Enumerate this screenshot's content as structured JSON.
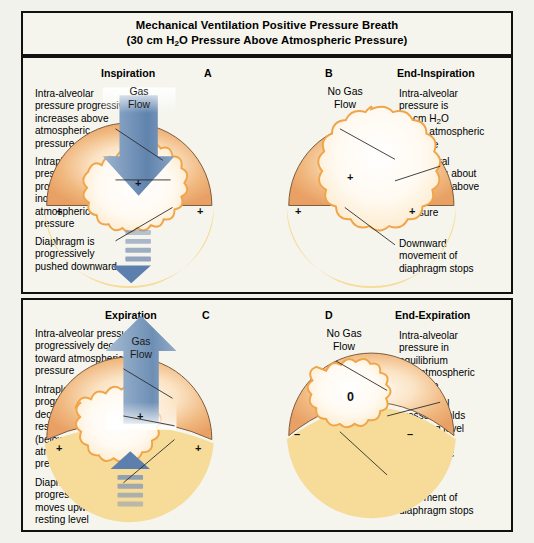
{
  "title": {
    "line1": "Mechanical Ventilation Positive Pressure Breath",
    "line2_pre": "(30 cm H",
    "line2_sub": "2",
    "line2_post": "O Pressure Above Atmospheric Pressure)"
  },
  "colors": {
    "border": "#111111",
    "background": "#f5f5ee",
    "lung_body": "#eeab6e",
    "lung_body_light": "#f7d9b4",
    "alveolar_light": "#fffdf8",
    "alveolar_outline": "#f0a54a",
    "diaphragm": "#f7dd9a",
    "arrow_blue_dark": "#5c7fae",
    "arrow_blue_light": "#cdd9e8",
    "leader_line": "#2b2b2b"
  },
  "panels": [
    {
      "id": "inspiration",
      "phase_title": "Inspiration",
      "letter": "A",
      "gas_flow_label": "Gas\nFlow",
      "gas_flow_direction": "down",
      "center_sign": "+",
      "left_sign": "+",
      "right_sign": "+",
      "annotations": [
        "Intra-alveolar\npressure progressively\nincreases above\natmospheric\npressure",
        "Intrapleural\npressure\nprogressively\nincreases above\natmospheric\npressure",
        "Diaphragm is\nprogressively\npushed downward"
      ]
    },
    {
      "id": "end-inspiration",
      "phase_title": "End-Inspiration",
      "letter": "B",
      "gas_flow_label": "No Gas\nFlow",
      "gas_flow_direction": "none",
      "center_sign": "+",
      "left_sign": "+",
      "right_sign": "+",
      "annotations": [
        "Intra-alveolar\npressure is\n30 cm H2O\nabove atmospheric\npressure",
        "Intrapleural\npressure is about\n30 cm H2O above\natmospheric\npressure",
        "Downward\nmovement of\ndiaphragm stops"
      ]
    },
    {
      "id": "expiration",
      "phase_title": "Expiration",
      "letter": "C",
      "gas_flow_label": "Gas\nFlow",
      "gas_flow_direction": "up",
      "center_sign": "+",
      "left_sign": "+",
      "right_sign": "+",
      "annotations": [
        "Intra-alveolar pressure\nprogressively decreases\ntoward atmospheric\npressure",
        "Intrapleural pressure\nprogressively\ndecreases to its\nresting level\n(below the\natmospheric\npressure)",
        "Diaphragm\nprogressively\nmoves upward to its\nresting level"
      ]
    },
    {
      "id": "end-expiration",
      "phase_title": "End-Expiration",
      "letter": "D",
      "gas_flow_label": "No Gas\nFlow",
      "gas_flow_direction": "none",
      "center_sign": "0",
      "left_sign": "–",
      "right_sign": "–",
      "annotations": [
        "Intra-alveolar\npressure in\nequilibrium\nwith atmospheric\npressure",
        "Intrapleural\npressure holds\nat resting level\n(below the\natmospheric\npressure)",
        "Upward\nmovement of\ndiaphragm stops"
      ]
    }
  ]
}
